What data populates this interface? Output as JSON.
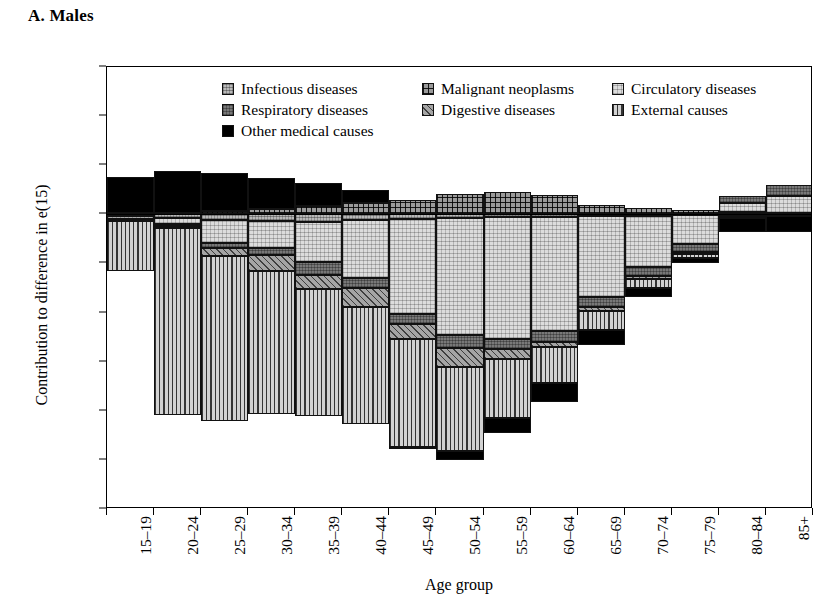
{
  "panel": {
    "title": "A. Males"
  },
  "axes": {
    "ylabel": "Contribution to difference in e(15)",
    "xlabel": "Age group",
    "yticks": [
      "0.3",
      "0.2",
      "0.1",
      "0",
      "−0.1",
      "−0.2",
      "−0.3",
      "−0.4",
      "−0.5",
      "−0.6"
    ],
    "ytick_values": [
      0.3,
      0.2,
      0.1,
      0,
      -0.1,
      -0.2,
      -0.3,
      -0.4,
      -0.5,
      -0.6
    ]
  },
  "legend": {
    "rows": [
      [
        {
          "label": "Infectious diseases",
          "key": "infectious"
        },
        {
          "label": "Malignant neoplasms",
          "key": "malignant"
        },
        {
          "label": "Circulatory diseases",
          "key": "circulatory"
        }
      ],
      [
        {
          "label": "Respiratory diseases",
          "key": "respiratory"
        },
        {
          "label": "Digestive diseases",
          "key": "digestive"
        },
        {
          "label": "External causes",
          "key": "external"
        }
      ],
      [
        {
          "label": "Other medical causes",
          "key": "other"
        }
      ]
    ]
  },
  "chart_data": {
    "type": "bar",
    "subtype": "stacked-bar-diverging",
    "title": "A. Males",
    "xlabel": "Age group",
    "ylabel": "Contribution to difference in e(15)",
    "ylim": [
      -0.6,
      0.3
    ],
    "ytick_step": 0.1,
    "grid": false,
    "legend_position": "inside-top",
    "categories": [
      "15–19",
      "20–24",
      "25–29",
      "30–34",
      "35–39",
      "40–44",
      "45–49",
      "50–54",
      "55–59",
      "60–64",
      "65–69",
      "70–74",
      "75–79",
      "80–84",
      "85+"
    ],
    "series": [
      {
        "name": "Infectious diseases",
        "key": "infectious",
        "fill": "light-gray-stipple",
        "values": [
          -0.004,
          -0.008,
          -0.012,
          -0.013,
          -0.015,
          -0.012,
          -0.01,
          -0.008,
          -0.006,
          -0.005,
          -0.004,
          -0.003,
          -0.002,
          -0.001,
          -0.001
        ]
      },
      {
        "name": "Malignant neoplasms",
        "key": "malignant",
        "fill": "crosshatch-grid",
        "values": [
          0.002,
          0.003,
          0.006,
          0.01,
          0.016,
          0.024,
          0.03,
          0.042,
          0.046,
          0.04,
          0.018,
          0.013,
          0.008,
          0.004,
          0.002
        ]
      },
      {
        "name": "Circulatory diseases",
        "key": "circulatory",
        "fill": "fine-dotted",
        "values": [
          -0.005,
          -0.012,
          -0.046,
          -0.056,
          -0.082,
          -0.118,
          -0.193,
          -0.238,
          -0.247,
          -0.232,
          -0.164,
          -0.104,
          -0.058,
          0.02,
          0.036
        ]
      },
      {
        "name": "Respiratory diseases",
        "key": "respiratory",
        "fill": "mid-gray-stipple",
        "values": [
          -0.002,
          -0.004,
          -0.01,
          -0.014,
          -0.026,
          -0.02,
          -0.02,
          -0.026,
          -0.022,
          -0.022,
          -0.02,
          -0.018,
          -0.016,
          0.014,
          0.022
        ]
      },
      {
        "name": "Digestive diseases",
        "key": "digestive",
        "fill": "diagonal-hatch",
        "values": [
          -0.002,
          -0.004,
          -0.016,
          -0.032,
          -0.03,
          -0.038,
          -0.03,
          -0.038,
          -0.02,
          -0.012,
          -0.008,
          -0.006,
          -0.004,
          -0.002,
          -0.001
        ]
      },
      {
        "name": "External causes",
        "key": "external",
        "fill": "vertical-stripes",
        "values": [
          -0.103,
          -0.38,
          -0.336,
          -0.292,
          -0.258,
          -0.238,
          -0.22,
          -0.172,
          -0.12,
          -0.072,
          -0.04,
          -0.02,
          -0.009,
          -0.004,
          -0.002
        ]
      },
      {
        "name": "Other medical causes",
        "key": "other",
        "fill": "solid-black",
        "values": [
          0.074,
          0.086,
          0.078,
          0.064,
          0.048,
          0.026,
          -0.005,
          -0.018,
          -0.03,
          -0.04,
          -0.03,
          -0.018,
          -0.01,
          -0.03,
          -0.032
        ]
      }
    ]
  }
}
